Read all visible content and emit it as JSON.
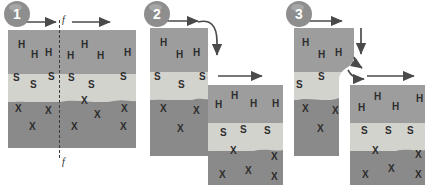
{
  "figure": {
    "type": "geologic-cross-section-sequence",
    "colors": {
      "layer_h": "#9d9d9d",
      "layer_s": "#d3d3ce",
      "layer_x": "#8a8a8a",
      "badge": "#8e8e8e",
      "arrow": "#4a4a4a",
      "fault_dash": "#3a3a3a",
      "label_text": "#2e2e2e",
      "background": "#ffffff"
    },
    "layer_labels": {
      "top": "H",
      "middle": "S",
      "bottom": "X"
    }
  },
  "stages": [
    {
      "number": "1",
      "caption": "",
      "fault_tag_top": "f",
      "fault_tag_bottom": "f",
      "layer_letters": {
        "h": [
          "H",
          "H",
          "H",
          "H",
          "H",
          "H"
        ],
        "s": [
          "S",
          "S",
          "S",
          "S",
          "S",
          "S"
        ],
        "x": [
          "X",
          "X",
          "X",
          "X",
          "X",
          "X",
          "X"
        ]
      },
      "arrows": [
        "left-block-right",
        "right-block-right"
      ]
    },
    {
      "number": "2",
      "caption": "",
      "layer_letters": {
        "h_left": [
          "H",
          "H",
          "H"
        ],
        "s_left": [
          "S",
          "S",
          "S"
        ],
        "x_left": [
          "X",
          "X",
          "X"
        ],
        "h_right": [
          "H",
          "H",
          "H",
          "H"
        ],
        "s_right": [
          "S",
          "S",
          "S"
        ],
        "x_right": [
          "X",
          "X",
          "X",
          "X",
          "X"
        ]
      },
      "arrows": [
        "left-block-right",
        "curved-down",
        "right-block-right"
      ]
    },
    {
      "number": "3",
      "caption": "",
      "layer_letters": {
        "h_left": [
          "H",
          "H",
          "H"
        ],
        "s_left": [
          "S",
          "S"
        ],
        "x_left": [
          "X",
          "X",
          "X"
        ],
        "h_right": [
          "H",
          "H",
          "H",
          "H"
        ],
        "s_right": [
          "S",
          "S",
          "S"
        ],
        "x_right": [
          "X",
          "X",
          "X",
          "X",
          "X"
        ]
      },
      "arrows": [
        "left-block-right",
        "down",
        "curved-elbow",
        "right-block-right"
      ]
    }
  ]
}
